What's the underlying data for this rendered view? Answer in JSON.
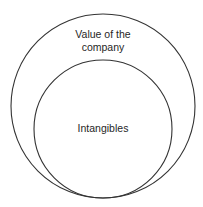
{
  "diagram": {
    "type": "nested-circles",
    "stroke_color": "#333333",
    "background": "#ffffff",
    "outer_circle": {
      "label_line1": "Value of the",
      "label_line2": "company"
    },
    "inner_circle": {
      "label": "Intangibles"
    }
  }
}
